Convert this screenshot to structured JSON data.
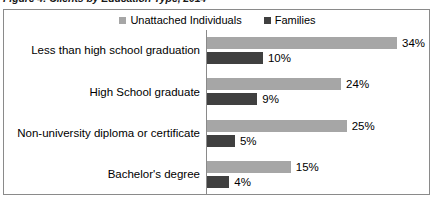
{
  "figure": {
    "title_cropped": "Figure 4: Clients by Education Type, 2014"
  },
  "chart_data": {
    "type": "bar",
    "orientation": "horizontal",
    "title": "Figure 4: Clients by Education Type, 2014",
    "xlabel": "",
    "ylabel": "",
    "grid": false,
    "legend_position": "top-center",
    "value_suffix": "%",
    "xlim": [
      0,
      34
    ],
    "categories": [
      "Less than high school graduation",
      "High School graduate",
      "Non-university diploma or certificate",
      "Bachelor's degree"
    ],
    "series": [
      {
        "name": "Unattached Individuals",
        "color": "#a6a6a6",
        "values": [
          34,
          24,
          25,
          15
        ],
        "labels": [
          "34%",
          "24%",
          "25%",
          "15%"
        ]
      },
      {
        "name": "Families",
        "color": "#404040",
        "values": [
          10,
          9,
          5,
          4
        ],
        "labels": [
          "10%",
          "9%",
          "5%",
          "4%"
        ]
      }
    ]
  },
  "colors": {
    "series_light": "#a6a6a6",
    "series_dark": "#404040",
    "frame": "#8a8a8a",
    "text": "#000000",
    "background": "#ffffff"
  }
}
